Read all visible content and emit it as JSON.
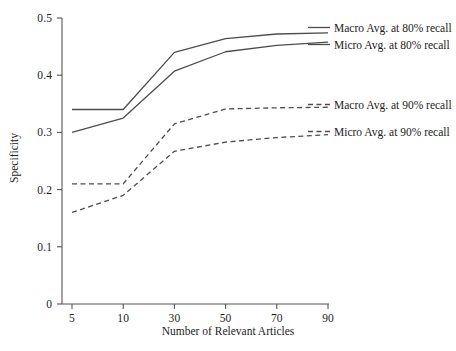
{
  "chart_data": {
    "type": "line",
    "title": "",
    "xlabel": "Number of Relevant Articles",
    "ylabel": "Specificity",
    "categories": [
      "5",
      "10",
      "30",
      "50",
      "70",
      "90"
    ],
    "x_tick_labels": [
      "5",
      "10",
      "30",
      "50",
      "70",
      "90"
    ],
    "y_tick_labels": [
      "0",
      "0.1",
      "0.2",
      "0.3",
      "0.4",
      "0.5"
    ],
    "y_tick_values": [
      0,
      0.1,
      0.2,
      0.3,
      0.4,
      0.5
    ],
    "ylim": [
      0,
      0.5
    ],
    "grid": false,
    "legend_position": "right-inline",
    "series": [
      {
        "name": "Macro Avg. at 80% recall",
        "style": "solid",
        "color": "#4d4d4d",
        "values": [
          0.34,
          0.34,
          0.44,
          0.464,
          0.472,
          0.474
        ]
      },
      {
        "name": "Micro Avg. at 80% recall",
        "style": "solid",
        "color": "#4d4d4d",
        "values": [
          0.3,
          0.325,
          0.407,
          0.441,
          0.452,
          0.458
        ]
      },
      {
        "name": "Macro Avg. at 90% recall",
        "style": "dashed",
        "color": "#4d4d4d",
        "values": [
          0.21,
          0.21,
          0.315,
          0.341,
          0.343,
          0.344
        ]
      },
      {
        "name": "Micro Avg. at 90% recall",
        "style": "dashed",
        "color": "#4d4d4d",
        "values": [
          0.16,
          0.19,
          0.267,
          0.283,
          0.291,
          0.296
        ]
      }
    ]
  },
  "legend": {
    "entries": [
      {
        "label": "Macro Avg. at 80% recall",
        "style": "solid"
      },
      {
        "label": "Micro Avg. at 80% recall",
        "style": "solid"
      },
      {
        "label": "Macro Avg. at 90% recall",
        "style": "dashed"
      },
      {
        "label": "Micro Avg. at 90% recall",
        "style": "dashed"
      }
    ]
  }
}
